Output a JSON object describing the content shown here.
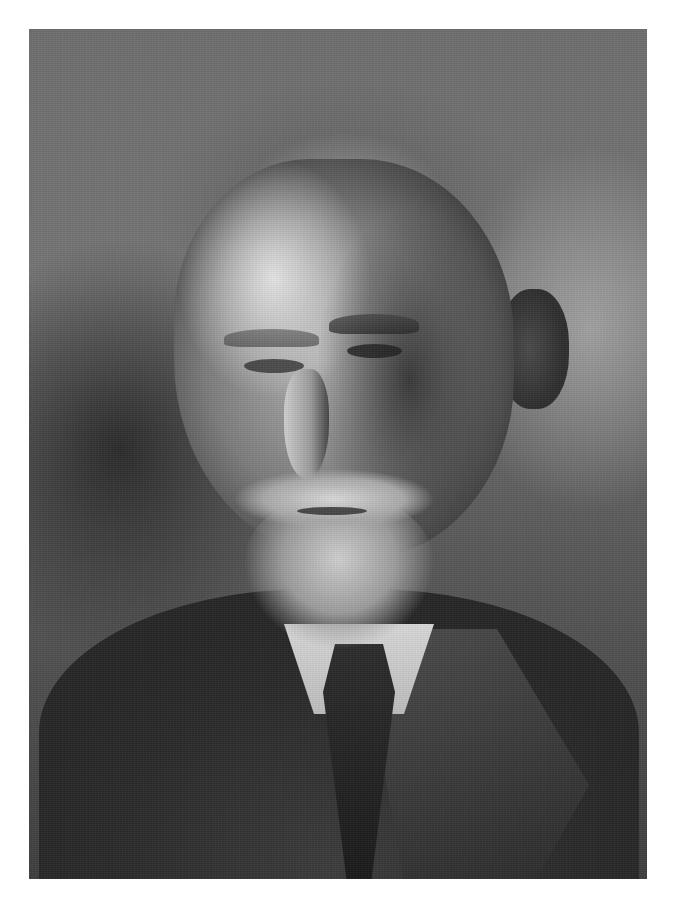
{
  "page": {
    "type": "scanned-document-page",
    "background_color": "#ffffff"
  },
  "photo": {
    "description": "Black-and-white portrait photograph of an elderly man with grey swept-back hair, white mustache and full beard, wearing a light shirt, dark tie and tweed suit jacket",
    "style": "monochrome",
    "tones": {
      "background": "#707070",
      "highlight": "#e4e4e4",
      "shadow": "#262626"
    }
  },
  "caption": {
    "text": "",
    "note": "caption line partially visible and cut off at bottom edge; text illegible"
  }
}
